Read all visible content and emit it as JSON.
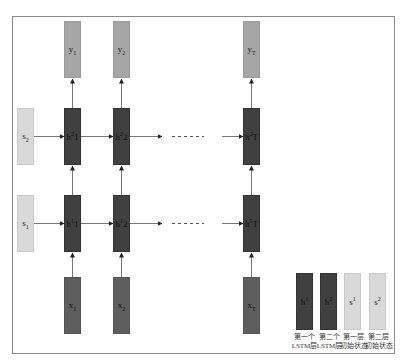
{
  "colors": {
    "output_box": "#a6a6a6",
    "hidden_box": "#404040",
    "input_box": "#5e5e5e",
    "state_box": "#d9d9d9",
    "frame": "#8a8a8a"
  },
  "outputs": [
    {
      "base": "y",
      "sub": "1"
    },
    {
      "base": "y",
      "sub": "2"
    },
    {
      "base": "y",
      "sub": "T"
    }
  ],
  "layer2_hidden": [
    {
      "base": "h",
      "sup": "2",
      "sub": "1"
    },
    {
      "base": "h",
      "sup": "2",
      "sub": "2"
    },
    {
      "base": "h",
      "sup": "2",
      "sub": "T"
    }
  ],
  "layer1_hidden": [
    {
      "base": "h",
      "sup": "1",
      "sub": "1"
    },
    {
      "base": "h",
      "sup": "1",
      "sub": "2"
    },
    {
      "base": "h",
      "sup": "1",
      "sub": "T"
    }
  ],
  "inputs": [
    {
      "base": "x",
      "sub": "1"
    },
    {
      "base": "x",
      "sub": "2"
    },
    {
      "base": "x",
      "sub": "T"
    }
  ],
  "initial_states": [
    {
      "base": "s",
      "sub": "2"
    },
    {
      "base": "s",
      "sub": "1"
    }
  ],
  "ellipsis": "- - - - - -",
  "legend": [
    {
      "symbol_base": "h",
      "symbol_sup": "1",
      "line1": "第一个",
      "line2": "LSTM层"
    },
    {
      "symbol_base": "h",
      "symbol_sup": "2",
      "line1": "第二个",
      "line2": "LSTM层"
    },
    {
      "symbol_base": "s",
      "symbol_sup": "1",
      "line1": "第一层",
      "line2": "初始状态"
    },
    {
      "symbol_base": "s",
      "symbol_sup": "2",
      "line1": "第二层",
      "line2": "初始状态"
    }
  ]
}
